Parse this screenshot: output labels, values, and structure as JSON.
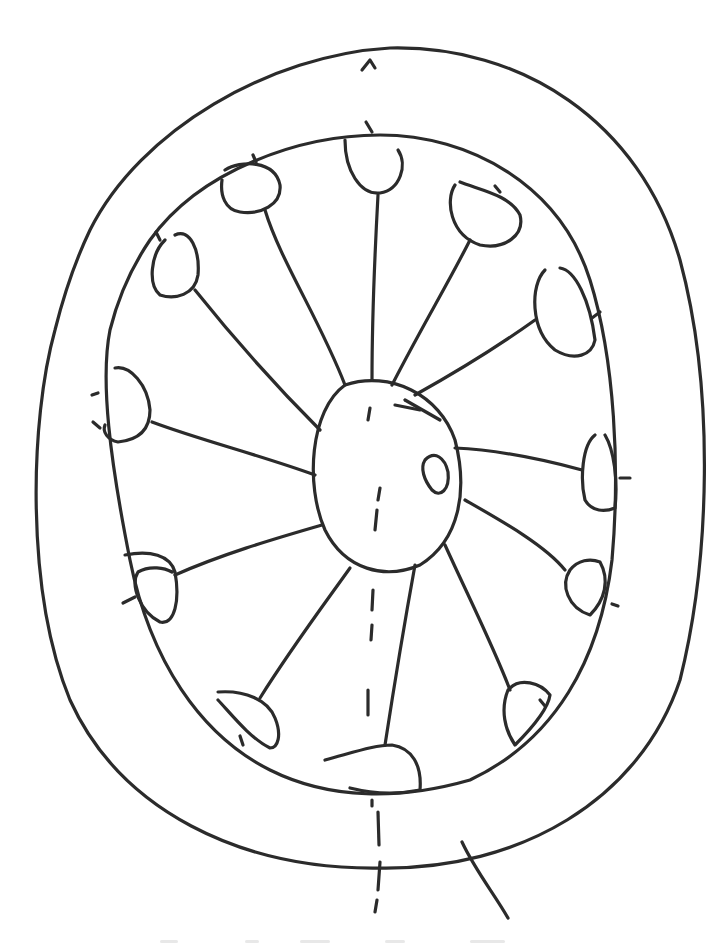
{
  "diagram": {
    "type": "hand-drawn sketch",
    "stroke_color": "#2b2b2b",
    "background": "#ffffff",
    "outer_ring": {
      "outer_path": "M90 230 C 140 130, 270 55, 390 48 C 520 45, 640 120, 680 260 C 715 390, 710 560, 680 680 C 640 800, 520 870, 380 868 C 240 870, 120 810, 70 700 C 25 590, 30 420, 55 330 C 65 290, 78 255, 90 230",
      "inner_path": "M150 240 C 200 170, 300 135, 380 135 C 470 135, 560 185, 590 280 C 615 360, 620 470, 612 560 C 600 660, 555 740, 470 780 C 400 800, 330 800, 270 770 C 200 735, 150 660, 130 560 C 110 460, 100 380, 110 330 C 120 290, 135 262, 150 240"
    },
    "hub": {
      "path": "M345 385 C 390 370, 440 395, 455 440 C 468 490, 460 540, 420 565 C 385 580, 345 570, 325 530 C 305 485, 310 410, 345 385",
      "small_loop": "M425 460 C 435 450, 445 458, 448 472 C 450 490, 440 498, 432 490 C 424 480, 420 468, 425 460"
    },
    "spokes": [
      {
        "id": 1,
        "line": "M345 385 C 320 320, 280 260, 265 210",
        "lobe": "M225 170 C 240 160, 275 160, 280 185 C 282 205, 260 215, 240 212 C 225 210, 220 195, 222 180"
      },
      {
        "id": 2,
        "line": "M372 380 C 372 310, 375 250, 378 195",
        "lobe": "M345 140 C 345 170, 360 195, 380 193 C 400 190, 408 165, 398 150"
      },
      {
        "id": 3,
        "line": "M392 385 C 420 330, 450 280, 470 240",
        "lobe": "M455 185 C 445 200, 450 235, 480 245 C 505 250, 525 235, 520 215 C 510 195, 480 190, 460 182"
      },
      {
        "id": 4,
        "line": "M415 395 C 460 370, 500 345, 535 320",
        "lobe": "M545 270 C 530 285, 530 330, 555 350 C 575 362, 592 355, 595 340 C 590 300, 575 270, 560 268"
      },
      {
        "id": 5,
        "line": "M455 448 C 500 450, 545 460, 582 470",
        "lobe": "M595 435 C 582 445, 580 480, 585 500 C 592 512, 605 512, 615 508 C 618 480, 614 450, 605 435"
      },
      {
        "id": 6,
        "line": "M465 500 C 500 520, 545 545, 565 570",
        "lobe": "M570 570 C 560 585, 568 608, 590 615 C 605 600, 610 580, 600 562 C 590 558, 578 560, 570 570"
      },
      {
        "id": 7,
        "line": "M445 545 C 470 600, 495 650, 510 690",
        "lobe": "M508 690 C 500 710, 505 730, 515 745 C 530 730, 548 710, 550 695 C 540 682, 520 678, 510 688"
      },
      {
        "id": 8,
        "line": "M415 565 C 405 620, 395 680, 385 745",
        "lobe": "M325 760 C 355 752, 375 745, 392 745 C 412 748, 422 765, 420 790 C 395 795, 370 793, 350 788"
      },
      {
        "id": 9,
        "line": "M350 568 C 320 610, 290 650, 260 698",
        "lobe": "M218 692 C 245 690, 268 700, 275 718 C 282 735, 278 748, 270 748 C 250 738, 232 715, 218 700"
      },
      {
        "id": 10,
        "line": "M322 525 C 270 540, 220 555, 175 575",
        "lobe": "M125 555 C 150 550, 170 555, 175 572 C 180 600, 175 625, 160 622 C 140 612, 130 585, 138 572 C 150 565, 165 568, 172 572"
      },
      {
        "id": 11,
        "line": "M315 475 C 260 455, 200 440, 152 422",
        "lobe": "M115 368 C 130 365, 148 385, 150 410 C 150 430, 138 440, 118 442 C 108 440, 102 432, 105 425"
      },
      {
        "id": 12,
        "line": "M320 430 C 280 390, 235 340, 195 290",
        "lobe": "M175 235 C 190 228, 200 250, 198 275 C 195 295, 175 300, 160 295 C 148 285, 150 255, 165 240"
      }
    ],
    "axis_marks": [
      {
        "id": "top-caret",
        "path": "M362 70 L 370 60 L 375 68"
      },
      {
        "id": "top-tick",
        "path": "M366 122 L 372 132"
      },
      {
        "id": "hub-dash-1",
        "path": "M370 408 L 368 420"
      },
      {
        "id": "hub-dash-2",
        "path": "M380 488 L 378 500 M377 510 L 375 530"
      },
      {
        "id": "lower-dash-1",
        "path": "M373 590 L 372 610"
      },
      {
        "id": "lower-dash-2",
        "path": "M372 625 L 371 640"
      },
      {
        "id": "lower-dash-3",
        "path": "M368 690 L 368 715"
      },
      {
        "id": "bottom-dash-1",
        "path": "M372 800 L 372 806"
      },
      {
        "id": "bottom-dash-2",
        "path": "M378 812 L 379 845"
      },
      {
        "id": "bottom-dash-3",
        "path": "M380 862 L 378 890"
      },
      {
        "id": "bottom-dash-4",
        "path": "M377 900 L 375 912"
      },
      {
        "id": "stem-right",
        "path": "M462 842 C 475 870, 495 895, 508 918"
      }
    ],
    "tick_marks": [
      "M253 155 L 256 162",
      "M495 186 L 500 192",
      "M156 232 L 160 240",
      "M592 318 L 600 312",
      "M92 395 L 98 393",
      "M93 422 L 100 428",
      "M620 478 L 630 478",
      "M612 604 L 618 606",
      "M123 603 L 135 597",
      "M240 736 L 243 745",
      "M540 700 L 545 706",
      "M405 400 L 440 420",
      "M395 405 L 420 410"
    ]
  }
}
